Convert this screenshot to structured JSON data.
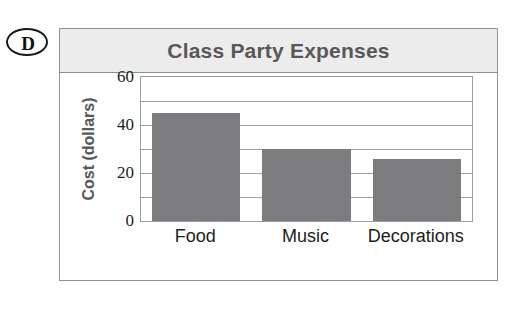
{
  "question_marker": {
    "letter": "D"
  },
  "figure": {
    "title": "Class Party Expenses"
  },
  "chart_data": {
    "type": "bar",
    "title": "Class Party Expenses",
    "categories": [
      "Food",
      "Music",
      "Decorations"
    ],
    "values": [
      45,
      30,
      26
    ],
    "xlabel": "",
    "ylabel": "Cost (dollars)",
    "ylim": [
      0,
      60
    ],
    "ytick_labels": [
      "0",
      "20",
      "40",
      "60"
    ],
    "ytick_values": [
      0,
      20,
      40,
      60
    ],
    "gridline_values": [
      10,
      20,
      30,
      40,
      50
    ],
    "grid": true,
    "legend": "none",
    "bar_color": "#7c7c7e",
    "grid_color": "#9a9da1",
    "title_color": "#58585a",
    "banner_color": "#ececec",
    "text_color": "#1b1d20"
  }
}
